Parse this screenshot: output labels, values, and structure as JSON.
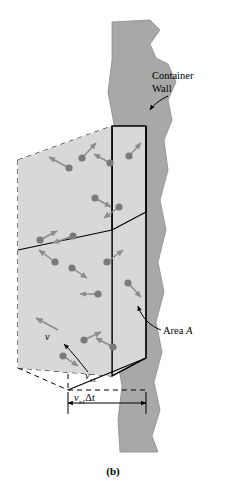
{
  "figure": {
    "caption": "(b)",
    "labels": {
      "container_wall_line1": "Container",
      "container_wall_line2": "Wall",
      "area": "Area A",
      "area_symbol": "A",
      "velocity_component": "vx1",
      "velocity_component_base": "v",
      "velocity_component_sub": "x1",
      "velocity_vector": "v",
      "distance": "vx1Δt",
      "distance_base": "v",
      "distance_sub": "x1",
      "distance_suffix": "Δt"
    },
    "colors": {
      "wall_fill": "#a8a8a8",
      "box_fill": "#d8d8d8",
      "molecule": "#7a7a7a",
      "arrow": "#8c8c8c",
      "line": "#000000"
    },
    "molecules": [
      {
        "x": 69,
        "y": 168,
        "ax": -20,
        "ay": -11
      },
      {
        "x": 82,
        "y": 158,
        "ax": 14,
        "ay": -15
      },
      {
        "x": 110,
        "y": 163,
        "ax": -16,
        "ay": -9
      },
      {
        "x": 129,
        "y": 156,
        "ax": 12,
        "ay": -13
      },
      {
        "x": 95,
        "y": 198,
        "ax": 16,
        "ay": 9
      },
      {
        "x": 119,
        "y": 207,
        "ax": -15,
        "ay": 11
      },
      {
        "x": 73,
        "y": 236,
        "ax": -20,
        "ay": 7
      },
      {
        "x": 40,
        "y": 240,
        "ax": 17,
        "ay": -9
      },
      {
        "x": 55,
        "y": 262,
        "ax": -16,
        "ay": -12
      },
      {
        "x": 72,
        "y": 268,
        "ax": 15,
        "ay": 10
      },
      {
        "x": 107,
        "y": 262,
        "ax": 16,
        "ay": -12
      },
      {
        "x": 98,
        "y": 294,
        "ax": -18,
        "ay": 0
      },
      {
        "x": 128,
        "y": 283,
        "ax": 13,
        "ay": 14
      },
      {
        "x": 84,
        "y": 340,
        "ax": 17,
        "ay": -8
      },
      {
        "x": 113,
        "y": 347,
        "ax": -17,
        "ay": -9
      },
      {
        "x": 63,
        "y": 356,
        "ax": 15,
        "ay": 10
      }
    ]
  }
}
